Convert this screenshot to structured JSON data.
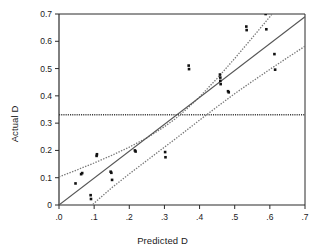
{
  "chart_data": {
    "type": "scatter",
    "title": "",
    "xlabel": "Predicted D",
    "ylabel": "Actual D",
    "xlim": [
      0,
      0.7
    ],
    "ylim": [
      0,
      0.7
    ],
    "grid": false,
    "legend": "none",
    "xticks": [
      0,
      0.1,
      0.2,
      0.3,
      0.4,
      0.5,
      0.6,
      0.7
    ],
    "xtick_labels": [
      ".0",
      ".1",
      ".2",
      ".3",
      ".4",
      ".5",
      ".6",
      ".7"
    ],
    "yticks": [
      0,
      0.1,
      0.2,
      0.3,
      0.4,
      0.5,
      0.6,
      0.7
    ],
    "ytick_labels": [
      "0",
      "0.1",
      "0.2",
      "0.3",
      "0.4",
      "0.5",
      "0.6",
      "0.7"
    ],
    "marker_color": "#111111",
    "line_color": "#555555",
    "band_color": "#777777",
    "points": [
      {
        "x": 0.047,
        "y": 0.079
      },
      {
        "x": 0.063,
        "y": 0.113
      },
      {
        "x": 0.066,
        "y": 0.117
      },
      {
        "x": 0.09,
        "y": 0.036
      },
      {
        "x": 0.091,
        "y": 0.022
      },
      {
        "x": 0.107,
        "y": 0.18
      },
      {
        "x": 0.108,
        "y": 0.186
      },
      {
        "x": 0.147,
        "y": 0.122
      },
      {
        "x": 0.149,
        "y": 0.118
      },
      {
        "x": 0.151,
        "y": 0.092
      },
      {
        "x": 0.216,
        "y": 0.2
      },
      {
        "x": 0.218,
        "y": 0.196
      },
      {
        "x": 0.302,
        "y": 0.194
      },
      {
        "x": 0.303,
        "y": 0.175
      },
      {
        "x": 0.369,
        "y": 0.511
      },
      {
        "x": 0.37,
        "y": 0.498
      },
      {
        "x": 0.458,
        "y": 0.478
      },
      {
        "x": 0.459,
        "y": 0.467
      },
      {
        "x": 0.459,
        "y": 0.455
      },
      {
        "x": 0.46,
        "y": 0.443
      },
      {
        "x": 0.481,
        "y": 0.417
      },
      {
        "x": 0.483,
        "y": 0.413
      },
      {
        "x": 0.533,
        "y": 0.654
      },
      {
        "x": 0.534,
        "y": 0.641
      },
      {
        "x": 0.588,
        "y": 0.7
      },
      {
        "x": 0.59,
        "y": 0.644
      },
      {
        "x": 0.613,
        "y": 0.553
      },
      {
        "x": 0.615,
        "y": 0.496
      }
    ],
    "fit_line": {
      "name": "regression line",
      "style": "solid",
      "x": [
        0.0,
        0.7
      ],
      "y": [
        0.0,
        0.69
      ]
    },
    "confidence_bands": {
      "style": "dotted",
      "upper": {
        "x": [
          0.0,
          0.05,
          0.1,
          0.15,
          0.2,
          0.25,
          0.3,
          0.33,
          0.36,
          0.4,
          0.45,
          0.5,
          0.55,
          0.6,
          0.62
        ],
        "y": [
          0.103,
          0.128,
          0.154,
          0.182,
          0.212,
          0.246,
          0.287,
          0.315,
          0.348,
          0.396,
          0.464,
          0.537,
          0.613,
          0.69,
          0.723
        ]
      },
      "lower": {
        "x": [
          0.085,
          0.1,
          0.15,
          0.2,
          0.25,
          0.3,
          0.33,
          0.36,
          0.4,
          0.45,
          0.5,
          0.55,
          0.6,
          0.65,
          0.7
        ],
        "y": [
          -0.012,
          0.007,
          0.063,
          0.114,
          0.163,
          0.212,
          0.241,
          0.271,
          0.311,
          0.36,
          0.408,
          0.453,
          0.497,
          0.54,
          0.582
        ]
      }
    },
    "reference_line": {
      "name": "mean reference line",
      "style": "dotted-horizontal",
      "y": 0.331
    }
  }
}
